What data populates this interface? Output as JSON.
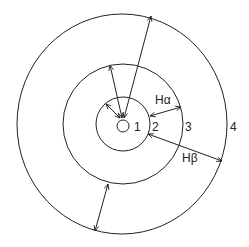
{
  "diagram": {
    "title": "",
    "center": {
      "x": 123,
      "y": 124
    },
    "orbits": [
      {
        "id": 1,
        "label": "1",
        "radius": 6,
        "label_pos": {
          "x": 137,
          "y": 131
        }
      },
      {
        "id": 2,
        "label": "2",
        "radius": 27,
        "label_pos": {
          "x": 154,
          "y": 131
        }
      },
      {
        "id": 3,
        "label": "3",
        "radius": 60,
        "label_pos": {
          "x": 186,
          "y": 131
        }
      },
      {
        "id": 4,
        "label": "4",
        "radius": 106,
        "label_pos": {
          "x": 231,
          "y": 131
        }
      }
    ],
    "transitions": [
      {
        "name": "H-alpha",
        "label": "Hα",
        "from_orbit": 3,
        "to_orbit": 2,
        "label_pos": {
          "x": 163,
          "y": 105
        }
      },
      {
        "name": "H-beta",
        "label": "Hβ",
        "from_orbit": 4,
        "to_orbit": 2,
        "label_pos": {
          "x": 190,
          "y": 161
        }
      }
    ],
    "stroke_color": "#222222",
    "background_color": "#ffffff"
  }
}
